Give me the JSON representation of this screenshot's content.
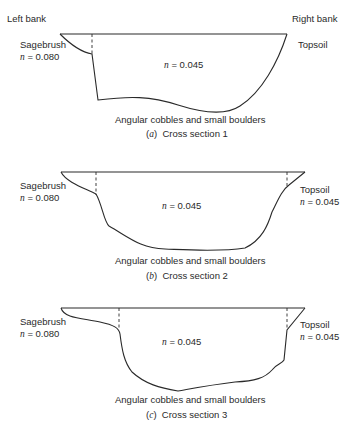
{
  "header": {
    "left_bank": "Left bank",
    "right_bank": "Right bank"
  },
  "sections": [
    {
      "id": "a",
      "left_label": "Sagebrush",
      "left_n": "= 0.080",
      "center_n": "= 0.045",
      "right_label": "Topsoil",
      "right_n": "",
      "bed": "Angular cobbles and small boulders",
      "caption_letter": "a",
      "caption_text": "Cross section 1"
    },
    {
      "id": "b",
      "left_label": "Sagebrush",
      "left_n": "= 0.080",
      "center_n": "= 0.045",
      "right_label": "Topsoil",
      "right_n": "= 0.045",
      "bed": "Angular cobbles and small boulders",
      "caption_letter": "b",
      "caption_text": "Cross section 2"
    },
    {
      "id": "c",
      "left_label": "Sagebrush",
      "left_n": "= 0.080",
      "center_n": "= 0.045",
      "right_label": "Topsoil",
      "right_n": "= 0.045",
      "bed": "Angular cobbles and small boulders",
      "caption_letter": "c",
      "caption_text": "Cross section 3"
    }
  ],
  "symbols": {
    "n": "n"
  }
}
